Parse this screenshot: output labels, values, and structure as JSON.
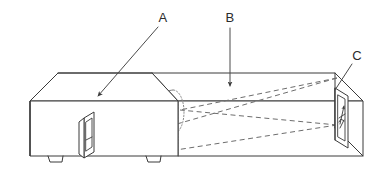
{
  "figure": {
    "type": "technical-line-drawing",
    "background_color": "#ffffff",
    "line_color": "#3a3a3a",
    "hidden_line_color": "#8a8a8a",
    "beam_line_color": "#6d6d6d",
    "callouts": [
      {
        "id": "A",
        "label": "A",
        "label_x": 163,
        "label_y": 22,
        "leader_from_x": 158,
        "leader_from_y": 27,
        "leader_to_x": 98,
        "leader_to_y": 96,
        "arrow_angle_deg": 131,
        "target": "left-enclosure-top-face"
      },
      {
        "id": "B",
        "label": "B",
        "label_x": 227,
        "label_y": 22,
        "leader_from_x": 230,
        "leader_from_y": 28,
        "leader_to_x": 230,
        "leader_to_y": 86,
        "arrow_angle_deg": 90,
        "target": "right-chamber-top-face"
      },
      {
        "id": "C",
        "label": "C",
        "label_x": 355,
        "label_y": 60,
        "leader_from_x": 352,
        "leader_from_y": 64,
        "leader_to_x": 335,
        "leader_to_y": 90,
        "arrow_angle_deg": 0,
        "target": "right-end-panel-detail"
      }
    ],
    "parts": {
      "left_enclosure": {
        "name": "left-enclosure",
        "description": "small box with hinged front door panel and two feet"
      },
      "right_chamber": {
        "name": "right-chamber",
        "description": "long box with hidden cylinder and dashed projection cone"
      },
      "door_panel": {
        "name": "door-panel",
        "description": "raised rectangular door on left enclosure front face"
      },
      "end_panel": {
        "name": "end-panel-detail",
        "description": "right end panel with arrow marking"
      },
      "hidden_cylinder": {
        "name": "hidden-cylinder",
        "description": "dotted cylinder at junction of the two enclosures"
      },
      "feet": {
        "name": "support-feet",
        "count": 2
      }
    }
  }
}
